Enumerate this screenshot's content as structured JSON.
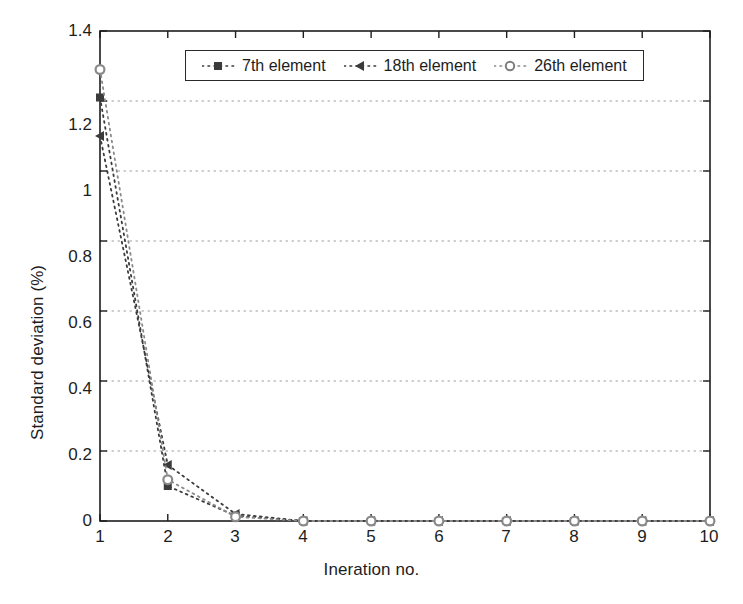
{
  "chart_data": {
    "type": "line",
    "title": "",
    "xlabel": "Ineration no.",
    "ylabel": "Standard deviation (%)",
    "xlim": [
      1,
      10
    ],
    "ylim": [
      0,
      1.4
    ],
    "xticks": [
      1,
      2,
      3,
      4,
      5,
      6,
      7,
      8,
      9,
      10
    ],
    "xticklabels": [
      "1",
      "2",
      "3",
      "4",
      "5",
      "6",
      "7",
      "8",
      "9",
      "10"
    ],
    "yticks": [
      0,
      0.2,
      0.4,
      0.6,
      0.8,
      1,
      1.2,
      1.4
    ],
    "yticklabels": [
      "0",
      "0.2",
      "0.4",
      "0.6",
      "0.8",
      "1",
      "1.2",
      "1.4"
    ],
    "grid": "horizontal-dotted",
    "legend_position": "upper center",
    "linestyle": "dotted",
    "x": [
      1,
      2,
      3,
      4,
      5,
      6,
      7,
      8,
      9,
      10
    ],
    "series": [
      {
        "name": "7th element",
        "marker": "square",
        "color": "#3b3b3b",
        "values": [
          1.21,
          0.1,
          0.015,
          0.0,
          0.0,
          0.0,
          0.0,
          0.0,
          0.0,
          0.0
        ]
      },
      {
        "name": "18th element",
        "marker": "triangle-left",
        "color": "#3b3b3b",
        "values": [
          1.1,
          0.16,
          0.02,
          0.0,
          0.0,
          0.0,
          0.0,
          0.0,
          0.0,
          0.0
        ]
      },
      {
        "name": "26th element",
        "marker": "circle",
        "color": "#8a8a8a",
        "values": [
          1.29,
          0.118,
          0.012,
          0.0,
          0.0,
          0.0,
          0.0,
          0.0,
          0.0,
          0.0
        ]
      }
    ]
  },
  "legend": {
    "items": [
      {
        "label": "7th element",
        "marker": "square"
      },
      {
        "label": "18th element",
        "marker": "triangle-left"
      },
      {
        "label": "26th element",
        "marker": "circle"
      }
    ]
  },
  "colors": {
    "axis": "#1d1d1d",
    "grid": "#9a9a9a",
    "series_dark": "#3b3b3b",
    "series_gray": "#8a8a8a",
    "background": "#ffffff"
  }
}
